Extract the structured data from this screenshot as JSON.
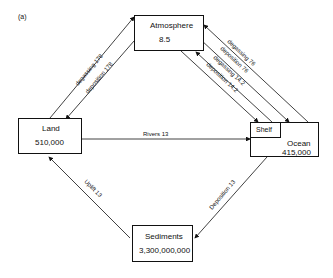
{
  "panel_label": "(a)",
  "reservoirs": {
    "atmosphere": {
      "name": "Atmosphere",
      "value": "8.5"
    },
    "land": {
      "name": "Land",
      "value": "510,000"
    },
    "ocean": {
      "name": "Ocean",
      "value": "415,000"
    },
    "shelf": {
      "name": "Shelf"
    },
    "sediments": {
      "name": "Sediments",
      "value": "3,300,000,000"
    }
  },
  "fluxes": {
    "land_degassing": "degassing  178",
    "land_deposition": "deposition  178",
    "ocean_degassing": "degassing  76",
    "ocean_deposition": "deposition  76",
    "shelf_degassing": "degassing  14.2",
    "shelf_deposition": "deposition  14.2",
    "rivers": "Rivers   13",
    "uplift": "Uplift   13",
    "sed_deposition": "Deposition  13"
  }
}
